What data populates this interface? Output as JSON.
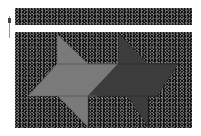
{
  "scene": {
    "background": "#ffffff",
    "noise_base": "#141414",
    "top_band": {
      "x": 15,
      "y": 8,
      "w": 177,
      "h": 17
    },
    "main_panel": {
      "x": 15,
      "y": 32,
      "w": 177,
      "h": 96
    },
    "indicator": {
      "color": "#9a9a9a"
    }
  },
  "shapes": [
    {
      "name": "light-star-shape",
      "fill": "#7a7a7a",
      "edge": "#5a5a5a",
      "points": "57,34 88,64 118,64 97,96 88,96 88,127 58,96 28,96 57,64"
    },
    {
      "name": "dark-star-shape",
      "fill": "#3c3c3c",
      "edge": "#2e2e2e",
      "points": "119,34 148,64 178,64 157,96 148,96 148,127 128,96 88,96 118,64"
    }
  ]
}
